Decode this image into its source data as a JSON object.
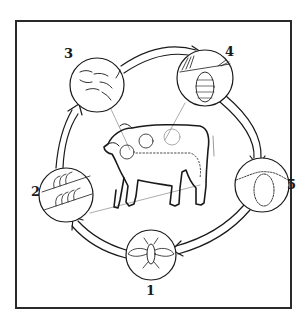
{
  "diagram": {
    "type": "life-cycle",
    "center_image": "cow",
    "stages": [
      {
        "number": "1",
        "depicts": "adult fly"
      },
      {
        "number": "2",
        "depicts": "eggs attached to hairs"
      },
      {
        "number": "3",
        "depicts": "larvae migrating"
      },
      {
        "number": "4",
        "depicts": "larva (grub) under skin of back"
      },
      {
        "number": "5",
        "depicts": "pupa in soil"
      }
    ],
    "flow_direction": "clockwise: 1 → 2 → 3 → 4 → 5 → 1",
    "colors": {
      "line": "#1a1a1a",
      "background": "#ffffff"
    }
  }
}
